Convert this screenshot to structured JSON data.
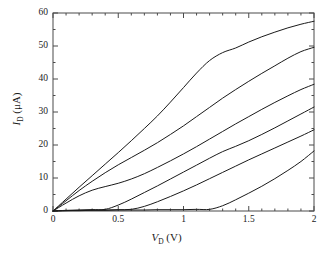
{
  "figure": {
    "kind": "xy-plot",
    "line_color": "#1a1a1a",
    "frame_color": "#4a4a4a",
    "background": "#ffffff"
  },
  "axes": {
    "x": {
      "label_prefix": "V",
      "label_sub": "D",
      "label_unit": "(V)",
      "label_full": "V_D (V)",
      "min": 0,
      "max": 2,
      "major_ticks": [
        0,
        0.5,
        1,
        1.5,
        2
      ],
      "tick_labels": [
        "0",
        "0.5",
        "1",
        "1.5",
        "2"
      ],
      "minor_ticks": [
        0.1,
        0.2,
        0.3,
        0.4,
        0.6,
        0.7,
        0.8,
        0.9,
        1.1,
        1.2,
        1.3,
        1.4,
        1.6,
        1.7,
        1.8,
        1.9
      ]
    },
    "y": {
      "label_prefix": "I",
      "label_sub": "D",
      "label_unit": "(μA)",
      "label_full": "I_D (μA)",
      "min": 0,
      "max": 60,
      "major_ticks": [
        0,
        10,
        20,
        30,
        40,
        50,
        60
      ],
      "tick_labels": [
        "0",
        "10",
        "20",
        "30",
        "40",
        "50",
        "60"
      ],
      "minor_ticks": [
        5,
        15,
        25,
        35,
        45,
        55
      ]
    }
  },
  "chart_data": {
    "type": "line",
    "title": "",
    "subtitle": "",
    "xlabel": "V_D (V)",
    "ylabel": "I_D (μA)",
    "xlim": [
      0,
      2
    ],
    "ylim": [
      0,
      60
    ],
    "grid": false,
    "legend": "none",
    "x": [
      0,
      0.1,
      0.2,
      0.3,
      0.4,
      0.5,
      0.6,
      0.7,
      0.8,
      0.9,
      1.0,
      1.1,
      1.2,
      1.3,
      1.4,
      1.5,
      1.6,
      1.7,
      1.8,
      1.9,
      2.0
    ],
    "series": [
      {
        "name": "curve-1",
        "values": [
          0,
          3.6,
          7.2,
          10.7,
          14.2,
          17.7,
          21.3,
          25.0,
          28.8,
          33.0,
          37.4,
          41.8,
          45.6,
          48.0,
          49.4,
          51.2,
          52.8,
          54.2,
          55.5,
          56.6,
          57.5
        ]
      },
      {
        "name": "curve-2",
        "values": [
          0,
          3.1,
          6.2,
          9.0,
          11.6,
          14.0,
          16.2,
          18.4,
          20.7,
          23.2,
          25.8,
          28.6,
          31.4,
          34.2,
          36.8,
          39.3,
          41.7,
          44.0,
          46.3,
          48.3,
          49.6
        ]
      },
      {
        "name": "curve-3",
        "values": [
          0,
          2.4,
          4.6,
          6.3,
          7.4,
          8.4,
          9.7,
          11.3,
          13.2,
          15.2,
          17.3,
          19.5,
          21.8,
          24.1,
          26.4,
          28.6,
          30.8,
          32.9,
          34.9,
          36.8,
          38.4
        ]
      },
      {
        "name": "curve-4",
        "values": [
          0,
          0.2,
          0.3,
          0.4,
          0.5,
          1.8,
          3.6,
          5.6,
          7.6,
          9.7,
          11.8,
          13.9,
          16.0,
          18.0,
          19.6,
          21.3,
          23.2,
          25.2,
          27.3,
          29.4,
          31.5
        ]
      },
      {
        "name": "curve-5",
        "values": [
          0,
          0.1,
          0.2,
          0.3,
          0.3,
          0.4,
          0.5,
          1.4,
          2.8,
          4.4,
          6.1,
          7.9,
          9.8,
          11.7,
          13.6,
          15.5,
          17.3,
          19.1,
          20.9,
          22.7,
          24.6
        ]
      },
      {
        "name": "curve-6",
        "values": [
          0,
          0.1,
          0.1,
          0.2,
          0.2,
          0.3,
          0.3,
          0.3,
          0.4,
          0.4,
          0.4,
          0.5,
          0.5,
          1.6,
          3.4,
          5.4,
          7.5,
          9.8,
          12.3,
          15.0,
          18.2
        ]
      }
    ]
  }
}
